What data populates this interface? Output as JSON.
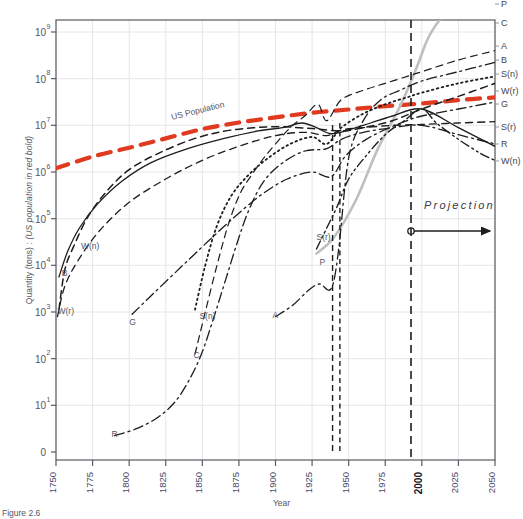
{
  "figure": {
    "caption": "Figure 2.6",
    "xlabel": "Year",
    "ylabel_main": "Quantity (tons) : ",
    "ylabel_italic": "(US population in red bold)",
    "ylabel_full": "Quantity (tons) : (US population in red bold)",
    "projection_label": "Projection",
    "us_population_label": "US Population",
    "accent_red": "#E03A21",
    "axis_color": "#5a5a62",
    "grid_color": "#e2e2e6",
    "tick_label_color": "#4a4a6a",
    "bold_tick_color": "#1a1a2e"
  },
  "chart_data": {
    "type": "line",
    "title": "",
    "subtitle": "",
    "xlabel": "Year",
    "ylabel": "Quantity (tons) : (US population in red bold)",
    "xlim": [
      1750,
      2050
    ],
    "ylim_log_decades": [
      0,
      9
    ],
    "yscale": "log",
    "grid": true,
    "legend_position": "right-edge-line-labels",
    "annotations": [
      {
        "text": "US Population",
        "x": 1848,
        "y_log": 6.9,
        "style": "rotated-red-curve-label"
      },
      {
        "text": "Projection",
        "x": 2018,
        "y_log": 4.55,
        "style": "italic-letterspaced"
      },
      {
        "text": "projection-divider",
        "x": 2000,
        "style": "vertical-dashed-line"
      },
      {
        "text": "projection-arrow",
        "x_from": 2000,
        "x_to": 2050,
        "y_log": 4.05,
        "style": "arrow-right-with-circle"
      }
    ],
    "xticks": [
      1750,
      1775,
      1800,
      1825,
      1850,
      1875,
      1900,
      1925,
      1950,
      1975,
      2000,
      2025,
      2050
    ],
    "xtick_labels": [
      "1750",
      "1775",
      "1800",
      "1825",
      "1850",
      "1875",
      "1900",
      "1925",
      "1950",
      "1975",
      "2000",
      "2025",
      "2050"
    ],
    "xtick_bold": [
      "2000"
    ],
    "yticks_log": [
      1,
      2,
      3,
      4,
      5,
      6,
      7,
      8,
      9
    ],
    "ytick_labels": [
      "10",
      "10",
      "10",
      "10",
      "10",
      "10",
      "10",
      "10",
      "10"
    ],
    "ytick_exponents": [
      "1",
      "2",
      "3",
      "4",
      "5",
      "6",
      "7",
      "8",
      "9"
    ],
    "ytick_zero_label": "0",
    "series": [
      {
        "name": "US Population",
        "code": "USPop",
        "color": "#E03A21",
        "linestyle": "dashed-bold",
        "width": 4.2,
        "right_label": "",
        "points": [
          [
            1750,
            6.08
          ],
          [
            1775,
            6.33
          ],
          [
            1800,
            6.52
          ],
          [
            1825,
            6.72
          ],
          [
            1850,
            6.92
          ],
          [
            1875,
            7.06
          ],
          [
            1900,
            7.17
          ],
          [
            1925,
            7.27
          ],
          [
            1950,
            7.34
          ],
          [
            1975,
            7.41
          ],
          [
            2000,
            7.47
          ],
          [
            2025,
            7.54
          ],
          [
            2050,
            7.6
          ]
        ]
      },
      {
        "name": "Phosphorus",
        "code": "P",
        "color": "#bfbfbf",
        "linestyle": "solid",
        "width": 2.6,
        "right_label": "P",
        "right_label_y": 3,
        "points": [
          [
            1928,
            4.25
          ],
          [
            1940,
            4.6
          ],
          [
            1955,
            5.4
          ],
          [
            1970,
            6.5
          ],
          [
            1985,
            7.4
          ],
          [
            1996,
            8.2
          ],
          [
            2004,
            8.85
          ],
          [
            2012,
            9.25
          ],
          [
            2022,
            9.6
          ]
        ]
      },
      {
        "name": "Copper",
        "code": "C",
        "color": "#1d1d1d",
        "linestyle": "dashed",
        "width": 1.2,
        "right_label": "C",
        "right_label_y": 22,
        "points": [
          [
            1845,
            2.1
          ],
          [
            1852,
            3.0
          ],
          [
            1860,
            4.0
          ],
          [
            1868,
            4.9
          ],
          [
            1876,
            5.55
          ],
          [
            1884,
            5.95
          ],
          [
            1892,
            6.3
          ],
          [
            1900,
            6.6
          ],
          [
            1910,
            6.95
          ],
          [
            1920,
            7.2
          ],
          [
            1929,
            7.45
          ],
          [
            1935,
            7.1
          ],
          [
            1945,
            7.55
          ],
          [
            1960,
            7.75
          ],
          [
            1975,
            7.9
          ],
          [
            1990,
            8.05
          ],
          [
            2000,
            8.15
          ],
          [
            2025,
            8.4
          ],
          [
            2050,
            8.6
          ]
        ]
      },
      {
        "name": "Aggregate",
        "code": "A",
        "color": "#1d1d1d",
        "linestyle": "dashdot",
        "width": 1.3,
        "right_label": "A",
        "right_label_y": 45,
        "points": [
          [
            1900,
            2.9
          ],
          [
            1912,
            3.15
          ],
          [
            1922,
            3.45
          ],
          [
            1930,
            3.6
          ],
          [
            1938,
            3.5
          ],
          [
            1943,
            4.3
          ],
          [
            1950,
            6.3
          ],
          [
            1960,
            7.1
          ],
          [
            1972,
            7.55
          ],
          [
            1985,
            7.75
          ],
          [
            2000,
            7.95
          ],
          [
            2025,
            8.15
          ],
          [
            2050,
            8.35
          ]
        ]
      },
      {
        "name": "Biomass",
        "code": "B",
        "color": "#1d1d1d",
        "linestyle": "dashed",
        "width": 1.5,
        "right_label": "B",
        "right_label_y": 59,
        "points": [
          [
            1752,
            3.05
          ],
          [
            1756,
            3.9
          ],
          [
            1762,
            4.4
          ],
          [
            1772,
            5.05
          ],
          [
            1785,
            5.6
          ],
          [
            1800,
            6.05
          ],
          [
            1820,
            6.4
          ],
          [
            1845,
            6.72
          ],
          [
            1870,
            6.9
          ],
          [
            1900,
            6.97
          ],
          [
            1925,
            6.93
          ],
          [
            1945,
            6.88
          ],
          [
            1960,
            6.95
          ],
          [
            1980,
            7.1
          ],
          [
            2000,
            7.35
          ],
          [
            2025,
            7.62
          ],
          [
            2050,
            7.9
          ]
        ]
      },
      {
        "name": "Stone (nonrenewable)",
        "code": "S(n)",
        "color": "#1d1d1d",
        "linestyle": "dotted",
        "width": 1.8,
        "right_label": "S(n)",
        "right_label_y": 73,
        "points": [
          [
            1845,
            3.05
          ],
          [
            1852,
            4.0
          ],
          [
            1860,
            4.85
          ],
          [
            1870,
            5.5
          ],
          [
            1882,
            5.95
          ],
          [
            1895,
            6.3
          ],
          [
            1910,
            6.6
          ],
          [
            1925,
            6.75
          ],
          [
            1935,
            6.6
          ],
          [
            1945,
            6.95
          ],
          [
            1960,
            7.25
          ],
          [
            1975,
            7.45
          ],
          [
            1990,
            7.6
          ],
          [
            2000,
            7.7
          ],
          [
            2025,
            7.9
          ],
          [
            2050,
            8.05
          ]
        ]
      },
      {
        "name": "Wood (renewable)",
        "code": "W(r)",
        "color": "#1d1d1d",
        "linestyle": "dashed",
        "width": 1.3,
        "right_label": "W(r)",
        "right_label_y": 90,
        "points": [
          [
            1751,
            2.9
          ],
          [
            1756,
            3.55
          ],
          [
            1765,
            4.1
          ],
          [
            1780,
            4.75
          ],
          [
            1800,
            5.35
          ],
          [
            1825,
            5.85
          ],
          [
            1850,
            6.25
          ],
          [
            1875,
            6.55
          ],
          [
            1900,
            6.78
          ],
          [
            1920,
            6.85
          ],
          [
            1935,
            6.78
          ],
          [
            1945,
            6.9
          ],
          [
            1960,
            6.95
          ],
          [
            1980,
            7.0
          ],
          [
            2000,
            7.02
          ],
          [
            2025,
            7.05
          ],
          [
            2050,
            7.08
          ]
        ]
      },
      {
        "name": "Geothermal / Gas",
        "code": "G",
        "color": "#1d1d1d",
        "linestyle": "dashdot",
        "width": 1.3,
        "right_label": "G",
        "right_label_y": 103,
        "points": [
          [
            1802,
            2.95
          ],
          [
            1815,
            3.35
          ],
          [
            1830,
            3.8
          ],
          [
            1845,
            4.25
          ],
          [
            1862,
            4.75
          ],
          [
            1878,
            5.2
          ],
          [
            1892,
            5.55
          ],
          [
            1908,
            5.85
          ],
          [
            1925,
            6.0
          ],
          [
            1938,
            5.9
          ],
          [
            1948,
            6.35
          ],
          [
            1962,
            6.7
          ],
          [
            1978,
            6.95
          ],
          [
            1990,
            7.1
          ],
          [
            2000,
            7.2
          ],
          [
            2025,
            7.35
          ],
          [
            2050,
            7.5
          ]
        ]
      },
      {
        "name": "Stone (recycled)",
        "code": "S(r)",
        "color": "#1d1d1d",
        "linestyle": "dashdotdot",
        "width": 1.4,
        "right_label": "S(r)",
        "right_label_y": 126,
        "points": [
          [
            1928,
            4.35
          ],
          [
            1935,
            4.8
          ],
          [
            1942,
            5.25
          ],
          [
            1950,
            5.85
          ],
          [
            1962,
            6.35
          ],
          [
            1975,
            6.8
          ],
          [
            1988,
            7.1
          ],
          [
            2000,
            7.35
          ],
          [
            2010,
            7.05
          ],
          [
            2025,
            6.7
          ],
          [
            2040,
            6.4
          ],
          [
            2050,
            6.25
          ]
        ]
      },
      {
        "name": "Recycled metals",
        "code": "R",
        "color": "#1d1d1d",
        "linestyle": "dashdot",
        "width": 1.3,
        "right_label": "R",
        "right_label_y": 143,
        "points": [
          [
            1790,
            0.35
          ],
          [
            1805,
            0.5
          ],
          [
            1820,
            0.75
          ],
          [
            1832,
            1.1
          ],
          [
            1842,
            1.6
          ],
          [
            1850,
            2.15
          ],
          [
            1858,
            2.9
          ],
          [
            1866,
            3.7
          ],
          [
            1874,
            4.5
          ],
          [
            1882,
            5.2
          ],
          [
            1892,
            5.8
          ],
          [
            1905,
            6.2
          ],
          [
            1920,
            6.45
          ],
          [
            1935,
            6.5
          ],
          [
            1945,
            6.7
          ],
          [
            1960,
            6.85
          ],
          [
            1980,
            6.95
          ],
          [
            2000,
            7.0
          ],
          [
            2025,
            6.8
          ],
          [
            2050,
            6.6
          ]
        ]
      },
      {
        "name": "Wood (nonrenewable)",
        "code": "W(n)",
        "color": "#1d1d1d",
        "linestyle": "solid",
        "width": 1.3,
        "right_label": "W(n)",
        "right_label_y": 160,
        "points": [
          [
            1752,
            3.75
          ],
          [
            1758,
            4.3
          ],
          [
            1766,
            4.8
          ],
          [
            1778,
            5.3
          ],
          [
            1795,
            5.8
          ],
          [
            1815,
            6.2
          ],
          [
            1840,
            6.5
          ],
          [
            1865,
            6.72
          ],
          [
            1888,
            6.88
          ],
          [
            1905,
            6.95
          ],
          [
            1918,
            7.05
          ],
          [
            1928,
            6.95
          ],
          [
            1938,
            6.82
          ],
          [
            1950,
            6.9
          ],
          [
            1965,
            7.05
          ],
          [
            1980,
            7.2
          ],
          [
            2000,
            7.35
          ],
          [
            2025,
            6.95
          ],
          [
            2050,
            6.55
          ]
        ]
      }
    ],
    "inline_labels": [
      {
        "text": "W(n)",
        "x": 1767,
        "y_log": 4.35
      },
      {
        "text": "B",
        "x": 1754,
        "y_log": 3.78
      },
      {
        "text": "W(r)",
        "x": 1751,
        "y_log": 2.95
      },
      {
        "text": "G",
        "x": 1800,
        "y_log": 2.72
      },
      {
        "text": "S(n)",
        "x": 1848,
        "y_log": 2.85
      },
      {
        "text": "C",
        "x": 1844,
        "y_log": 2.02
      },
      {
        "text": "R",
        "x": 1788,
        "y_log": 0.33
      },
      {
        "text": "A",
        "x": 1898,
        "y_log": 2.88
      },
      {
        "text": "P",
        "x": 1930,
        "y_log": 4.0
      },
      {
        "text": "S(r)",
        "x": 1928,
        "y_log": 4.55
      }
    ]
  }
}
